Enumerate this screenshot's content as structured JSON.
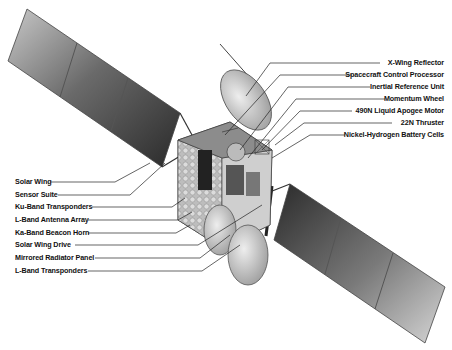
{
  "diagram": {
    "labels_right": [
      {
        "id": "x-wing-reflector",
        "text": "X-Wing Reflector",
        "y": 63
      },
      {
        "id": "spacecraft-control-processor",
        "text": "Spacecraft Control Processor",
        "y": 75
      },
      {
        "id": "inertial-reference-unit",
        "text": "Inertial Reference Unit",
        "y": 87
      },
      {
        "id": "momentum-wheel",
        "text": "Momentum Wheel",
        "y": 99
      },
      {
        "id": "liquid-apogee-motor",
        "text": "490N Liquid Apogee Motor",
        "y": 111
      },
      {
        "id": "thruster",
        "text": "22N Thruster",
        "y": 123
      },
      {
        "id": "battery-cells",
        "text": "Nickel-Hydrogen Battery Cells",
        "y": 135
      }
    ],
    "labels_left": [
      {
        "id": "solar-wing",
        "text": "Solar Wing",
        "y": 182
      },
      {
        "id": "sensor-suite",
        "text": "Sensor Suite",
        "y": 195
      },
      {
        "id": "ku-band-transponders",
        "text": "Ku-Band Transponders",
        "y": 207
      },
      {
        "id": "l-band-antenna-array",
        "text": "L-Band Antenna Array",
        "y": 220
      },
      {
        "id": "ka-band-beacon-horn",
        "text": "Ka-Band Beacon Horn",
        "y": 233
      },
      {
        "id": "solar-wing-drive",
        "text": "Solar Wing Drive",
        "y": 245
      },
      {
        "id": "mirrored-radiator-panel",
        "text": "Mirrored Radiator Panel",
        "y": 258
      },
      {
        "id": "l-band-transponders",
        "text": "L-Band Transponders",
        "y": 271
      }
    ]
  }
}
